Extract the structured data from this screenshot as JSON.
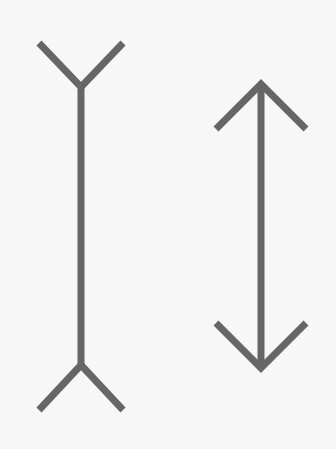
{
  "figure": {
    "title": "",
    "background": "#f7f7f7",
    "stroke_color": "#666666",
    "stroke_width": 7
  },
  "shapes": {
    "left_line": {
      "type": "fins-outward",
      "x": 81,
      "y1": 87,
      "y2": 365,
      "fin_dx": 42,
      "fin_dy": 44
    },
    "right_line": {
      "type": "arrowheads-inward",
      "x": 261,
      "y1": 84,
      "y2": 368,
      "head_dx": 45,
      "head_dy": 45
    }
  }
}
